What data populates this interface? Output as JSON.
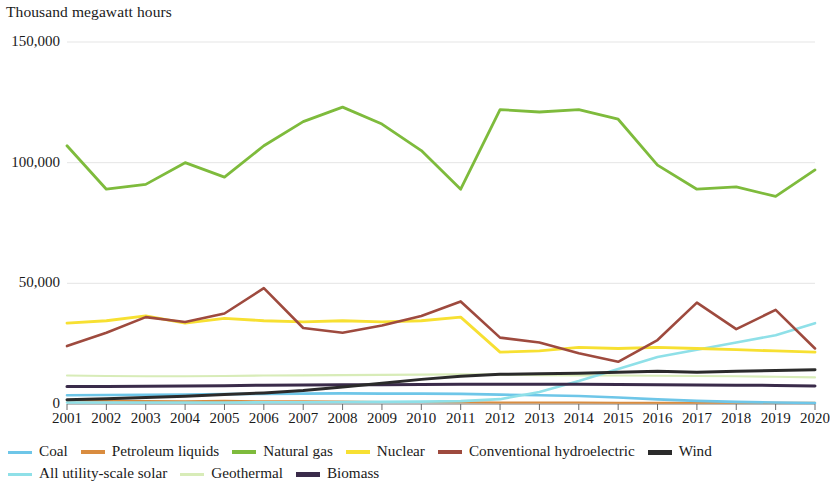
{
  "header": {
    "axis_title": "Thousand megawatt hours"
  },
  "chart_data": {
    "type": "line",
    "title": "Thousand megawatt hours",
    "xlabel": "",
    "ylabel": "Thousand megawatt hours",
    "ylim": [
      0,
      150000
    ],
    "yticks": [
      0,
      50000,
      100000,
      150000
    ],
    "ytick_labels": [
      "0",
      "50,000",
      "100,000",
      "150,000"
    ],
    "grid": true,
    "legend_position": "bottom",
    "categories": [
      2001,
      2002,
      2003,
      2004,
      2005,
      2006,
      2007,
      2008,
      2009,
      2010,
      2011,
      2012,
      2013,
      2014,
      2015,
      2016,
      2017,
      2018,
      2019,
      2020
    ],
    "x_tick_labels": [
      "2001",
      "2002",
      "2003",
      "2004",
      "2005",
      "2006",
      "2007",
      "2008",
      "2009",
      "2010",
      "2011",
      "2012",
      "2013",
      "2014",
      "2015",
      "2016",
      "2017",
      "2018",
      "2019",
      "2020"
    ],
    "series": [
      {
        "name": "Coal",
        "color": "#6ec6e8",
        "values": [
          3600,
          3700,
          3800,
          3900,
          4100,
          4200,
          4300,
          4400,
          4300,
          4300,
          4200,
          3900,
          3600,
          3300,
          2700,
          1900,
          1300,
          900,
          600,
          400
        ]
      },
      {
        "name": "Petroleum liquids",
        "color": "#d98c3f",
        "values": [
          1500,
          1300,
          1200,
          1100,
          1300,
          1100,
          1100,
          1000,
          800,
          800,
          700,
          600,
          600,
          600,
          500,
          500,
          500,
          500,
          500,
          500
        ]
      },
      {
        "name": "Natural gas",
        "color": "#7ebb3c",
        "values": [
          107000,
          89000,
          91000,
          100000,
          94000,
          107000,
          117000,
          123000,
          116000,
          105000,
          89000,
          122000,
          121000,
          122000,
          118000,
          99000,
          89000,
          90000,
          86000,
          97000
        ]
      },
      {
        "name": "Nuclear",
        "color": "#f7e032",
        "values": [
          33500,
          34500,
          36500,
          33500,
          35500,
          34500,
          34000,
          34500,
          34000,
          34500,
          36000,
          21500,
          22000,
          23500,
          23000,
          23500,
          23000,
          22500,
          22000,
          21500
        ]
      },
      {
        "name": "Conventional hydroelectric",
        "color": "#9e4a3e",
        "values": [
          24000,
          29500,
          36000,
          34000,
          37500,
          48000,
          31500,
          29500,
          32500,
          36500,
          42500,
          27500,
          25500,
          21000,
          17500,
          26500,
          42000,
          31000,
          39000,
          23000
        ]
      },
      {
        "name": "Wind",
        "color": "#2b2b2b",
        "values": [
          1800,
          2200,
          2700,
          3200,
          3900,
          4600,
          5600,
          7000,
          8600,
          10200,
          11500,
          12300,
          12500,
          12700,
          13200,
          13600,
          13200,
          13600,
          13900,
          14200
        ]
      },
      {
        "name": "All utility-scale solar",
        "color": "#8fe0e8",
        "values": [
          600,
          600,
          600,
          600,
          600,
          700,
          700,
          800,
          900,
          1000,
          1200,
          2000,
          5000,
          9500,
          14500,
          19500,
          22500,
          25500,
          28500,
          33500
        ]
      },
      {
        "name": "Geothermal",
        "color": "#d8ecb8",
        "values": [
          11800,
          11600,
          11500,
          11500,
          11600,
          11800,
          11900,
          12000,
          12100,
          12200,
          12300,
          12200,
          12000,
          11900,
          11800,
          11700,
          11600,
          11500,
          11300,
          11000
        ]
      },
      {
        "name": "Biomass",
        "color": "#3a2b4a",
        "values": [
          7200,
          7300,
          7400,
          7500,
          7600,
          7800,
          7900,
          8000,
          8000,
          8100,
          8200,
          8200,
          8200,
          8200,
          8100,
          8000,
          7900,
          7800,
          7700,
          7500
        ]
      }
    ]
  },
  "legend": {
    "row1": [
      {
        "label": "Coal",
        "color": "#6ec6e8",
        "weight": 3
      },
      {
        "label": "Petroleum liquids",
        "color": "#d98c3f",
        "weight": 4
      },
      {
        "label": "Natural gas",
        "color": "#7ebb3c",
        "weight": 4
      },
      {
        "label": "Nuclear",
        "color": "#f7e032",
        "weight": 4
      },
      {
        "label": "Conventional hydroelectric",
        "color": "#9e4a3e",
        "weight": 4
      },
      {
        "label": "Wind",
        "color": "#2b2b2b",
        "weight": 5
      }
    ],
    "row2": [
      {
        "label": "All utility-scale solar",
        "color": "#8fe0e8",
        "weight": 3
      },
      {
        "label": "Geothermal",
        "color": "#d8ecb8",
        "weight": 3
      },
      {
        "label": "Biomass",
        "color": "#3a2b4a",
        "weight": 5
      }
    ]
  }
}
